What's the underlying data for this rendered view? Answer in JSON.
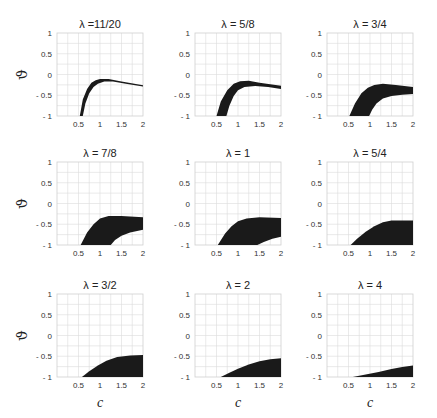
{
  "figure": {
    "ylabel": "ϑ",
    "xlabel": "c",
    "xticks": [
      "0.5",
      "1",
      "1.5",
      "2"
    ],
    "yticks": [
      "1",
      "0.5",
      "0",
      "- 0.5",
      "- 1"
    ]
  },
  "chart_data": [
    {
      "type": "area",
      "title": "λ =11/20",
      "xlim": [
        0,
        2
      ],
      "ylim": [
        -1,
        1
      ],
      "grid": true,
      "xlabel": "",
      "ylabel": "ϑ",
      "upper": [
        [
          0.53,
          -1
        ],
        [
          0.6,
          -0.6
        ],
        [
          0.7,
          -0.35
        ],
        [
          0.8,
          -0.2
        ],
        [
          0.9,
          -0.14
        ],
        [
          1.0,
          -0.11
        ],
        [
          1.2,
          -0.11
        ],
        [
          1.5,
          -0.17
        ],
        [
          2.0,
          -0.26
        ]
      ],
      "lower": [
        [
          0.6,
          -1
        ],
        [
          0.66,
          -0.7
        ],
        [
          0.75,
          -0.45
        ],
        [
          0.85,
          -0.3
        ],
        [
          0.95,
          -0.22
        ],
        [
          1.1,
          -0.17
        ],
        [
          1.3,
          -0.17
        ],
        [
          1.6,
          -0.22
        ],
        [
          2.0,
          -0.29
        ]
      ]
    },
    {
      "type": "area",
      "title": "λ = 5/8",
      "xlim": [
        0,
        2
      ],
      "ylim": [
        -1,
        1
      ],
      "grid": true,
      "xlabel": "",
      "ylabel": "",
      "upper": [
        [
          0.5,
          -1
        ],
        [
          0.6,
          -0.65
        ],
        [
          0.75,
          -0.38
        ],
        [
          0.9,
          -0.22
        ],
        [
          1.05,
          -0.16
        ],
        [
          1.25,
          -0.15
        ],
        [
          1.5,
          -0.2
        ],
        [
          2.0,
          -0.27
        ]
      ],
      "lower": [
        [
          0.73,
          -1
        ],
        [
          0.8,
          -0.75
        ],
        [
          0.9,
          -0.52
        ],
        [
          1.0,
          -0.38
        ],
        [
          1.15,
          -0.3
        ],
        [
          1.4,
          -0.28
        ],
        [
          1.7,
          -0.3
        ],
        [
          2.0,
          -0.35
        ]
      ]
    },
    {
      "type": "area",
      "title": "λ = 3/4",
      "xlim": [
        0,
        2
      ],
      "ylim": [
        -1,
        1
      ],
      "grid": true,
      "xlabel": "",
      "ylabel": "",
      "upper": [
        [
          0.52,
          -1
        ],
        [
          0.65,
          -0.7
        ],
        [
          0.8,
          -0.45
        ],
        [
          0.95,
          -0.32
        ],
        [
          1.1,
          -0.25
        ],
        [
          1.3,
          -0.22
        ],
        [
          1.6,
          -0.25
        ],
        [
          2.0,
          -0.3
        ]
      ],
      "lower": [
        [
          0.98,
          -1
        ],
        [
          1.05,
          -0.85
        ],
        [
          1.15,
          -0.7
        ],
        [
          1.3,
          -0.58
        ],
        [
          1.5,
          -0.52
        ],
        [
          1.75,
          -0.49
        ],
        [
          2.0,
          -0.47
        ]
      ]
    },
    {
      "type": "area",
      "title": "λ = 7/8",
      "xlim": [
        0,
        2
      ],
      "ylim": [
        -1,
        1
      ],
      "grid": true,
      "xlabel": "",
      "ylabel": "ϑ",
      "upper": [
        [
          0.55,
          -1
        ],
        [
          0.7,
          -0.7
        ],
        [
          0.85,
          -0.5
        ],
        [
          1.0,
          -0.36
        ],
        [
          1.2,
          -0.3
        ],
        [
          1.5,
          -0.3
        ],
        [
          2.0,
          -0.33
        ]
      ],
      "lower": [
        [
          1.25,
          -1
        ],
        [
          1.35,
          -0.88
        ],
        [
          1.5,
          -0.78
        ],
        [
          1.7,
          -0.7
        ],
        [
          2.0,
          -0.63
        ]
      ]
    },
    {
      "type": "area",
      "title": "λ = 1",
      "xlim": [
        0,
        2
      ],
      "ylim": [
        -1,
        1
      ],
      "grid": true,
      "xlabel": "",
      "ylabel": "",
      "upper": [
        [
          0.53,
          -1
        ],
        [
          0.7,
          -0.72
        ],
        [
          0.85,
          -0.55
        ],
        [
          1.0,
          -0.43
        ],
        [
          1.2,
          -0.36
        ],
        [
          1.5,
          -0.33
        ],
        [
          2.0,
          -0.35
        ]
      ],
      "lower": [
        [
          1.45,
          -1
        ],
        [
          1.6,
          -0.93
        ],
        [
          1.8,
          -0.85
        ],
        [
          2.0,
          -0.8
        ]
      ]
    },
    {
      "type": "area",
      "title": "λ = 5/4",
      "xlim": [
        0,
        2
      ],
      "ylim": [
        -1,
        1
      ],
      "grid": true,
      "xlabel": "",
      "ylabel": "",
      "upper": [
        [
          0.55,
          -1
        ],
        [
          0.7,
          -0.85
        ],
        [
          0.9,
          -0.68
        ],
        [
          1.1,
          -0.55
        ],
        [
          1.3,
          -0.45
        ],
        [
          1.5,
          -0.41
        ],
        [
          2.0,
          -0.41
        ]
      ],
      "lower": [
        [
          2.0,
          -1
        ]
      ]
    },
    {
      "type": "area",
      "title": "λ = 3/2",
      "xlim": [
        0,
        2
      ],
      "ylim": [
        -1,
        1
      ],
      "grid": true,
      "xlabel": "c",
      "ylabel": "ϑ",
      "upper": [
        [
          0.58,
          -1
        ],
        [
          0.75,
          -0.86
        ],
        [
          0.95,
          -0.72
        ],
        [
          1.15,
          -0.61
        ],
        [
          1.4,
          -0.52
        ],
        [
          1.7,
          -0.48
        ],
        [
          2.0,
          -0.47
        ]
      ],
      "lower": [
        [
          2.0,
          -1
        ]
      ]
    },
    {
      "type": "area",
      "title": "λ = 2",
      "xlim": [
        0,
        2
      ],
      "ylim": [
        -1,
        1
      ],
      "grid": true,
      "xlabel": "c",
      "ylabel": "",
      "upper": [
        [
          0.6,
          -1
        ],
        [
          0.8,
          -0.9
        ],
        [
          1.0,
          -0.8
        ],
        [
          1.25,
          -0.7
        ],
        [
          1.5,
          -0.62
        ],
        [
          1.75,
          -0.57
        ],
        [
          2.0,
          -0.55
        ]
      ],
      "lower": [
        [
          2.0,
          -1
        ]
      ]
    },
    {
      "type": "area",
      "title": "λ = 4",
      "xlim": [
        0,
        2
      ],
      "ylim": [
        -1,
        1
      ],
      "grid": true,
      "xlabel": "c",
      "ylabel": "",
      "upper": [
        [
          0.6,
          -1
        ],
        [
          0.9,
          -0.94
        ],
        [
          1.2,
          -0.88
        ],
        [
          1.5,
          -0.81
        ],
        [
          1.75,
          -0.76
        ],
        [
          2.0,
          -0.72
        ]
      ],
      "lower": [
        [
          2.0,
          -1
        ]
      ]
    }
  ]
}
